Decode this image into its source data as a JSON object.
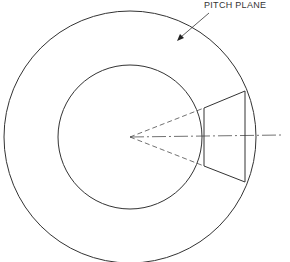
{
  "diagram": {
    "label": "PITCH PLANE",
    "center": [
      130,
      137
    ],
    "outer_circle_radius": 127,
    "inner_circle_radius": 72,
    "line_color": "#333333",
    "frustum": {
      "small_end_x": 204,
      "small_end_half_height": 29,
      "large_end_x": 245,
      "large_end_half_height": 45
    }
  }
}
